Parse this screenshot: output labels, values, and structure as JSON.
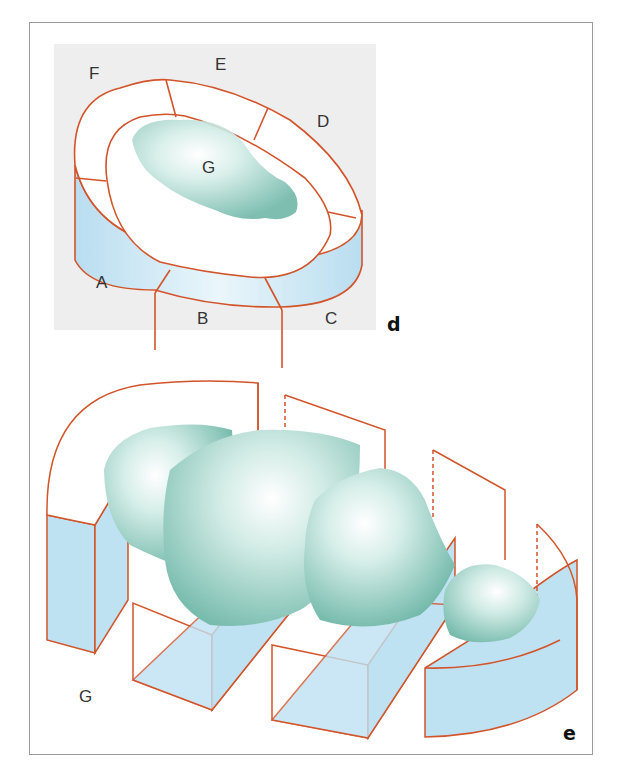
{
  "figure": {
    "panel_d": {
      "letter": "d",
      "labels": {
        "A": "A",
        "B": "B",
        "C": "C",
        "D": "D",
        "E": "E",
        "F": "F",
        "G": "G"
      }
    },
    "panel_e": {
      "letter": "e",
      "labels": {
        "G": "G"
      }
    },
    "colors": {
      "outline": "#d2542a",
      "section_fill": "#bfe2f3",
      "tumor_light": "#e8f6f3",
      "tumor_dark": "#6fb7a8",
      "panel_bg": "#eeeeee",
      "frame": "#9a9a9a"
    }
  }
}
